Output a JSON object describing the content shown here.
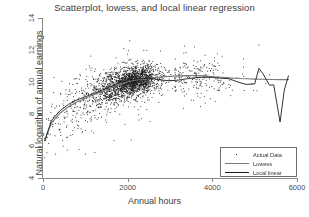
{
  "chart_data": {
    "type": "scatter",
    "title": "Scatterplot, lowess, and local linear regression",
    "xlabel": "Annual hours",
    "ylabel": "Natural logarithm of annual earnings",
    "xlim": [
      0,
      6000
    ],
    "ylim": [
      4,
      14
    ],
    "xticks": [
      0,
      2000,
      4000,
      6000
    ],
    "yticks": [
      4,
      6,
      8,
      10,
      12,
      14
    ],
    "xtick_labels": [
      "0",
      "2000",
      "4000",
      "6000"
    ],
    "ytick_labels": [
      "4",
      "6",
      "8",
      "10",
      "12",
      "14"
    ],
    "grid": false,
    "legend_position": "lower right",
    "legend": [
      {
        "label": "Actual Data",
        "marker": "point",
        "color": "#1d1d1d"
      },
      {
        "label": "Lowess",
        "marker": "line",
        "color": "#7a7a7a"
      },
      {
        "label": "Local linear",
        "marker": "line",
        "color": "#1d1d1d"
      }
    ],
    "series": [
      {
        "name": "Lowess",
        "type": "line",
        "color": "#7a7a7a",
        "x": [
          40,
          200,
          400,
          600,
          800,
          1000,
          1200,
          1400,
          1600,
          1800,
          2000,
          2200,
          2400,
          2600,
          2800,
          3000,
          3200,
          3400,
          3600,
          3800,
          4000,
          4200,
          4400,
          4600,
          4800,
          5000,
          5200,
          5400,
          5600,
          5800
        ],
        "y": [
          6.35,
          7.45,
          8.05,
          8.45,
          8.75,
          8.98,
          9.2,
          9.42,
          9.63,
          9.85,
          10.02,
          10.13,
          10.2,
          10.26,
          10.31,
          10.35,
          10.38,
          10.4,
          10.4,
          10.38,
          10.34,
          10.3,
          10.26,
          10.22,
          10.2,
          10.18,
          10.17,
          10.16,
          10.15,
          10.15
        ]
      },
      {
        "name": "Local linear",
        "type": "line",
        "color": "#1d1d1d",
        "x": [
          40,
          200,
          400,
          600,
          800,
          1000,
          1200,
          1400,
          1600,
          1800,
          2000,
          2200,
          2400,
          2600,
          2800,
          3000,
          3200,
          3400,
          3600,
          3800,
          4000,
          4200,
          4400,
          4600,
          4800,
          5000,
          5100,
          5200,
          5350,
          5450,
          5600,
          5700,
          5800
        ],
        "y": [
          6.3,
          7.6,
          8.2,
          8.6,
          8.88,
          9.08,
          9.28,
          9.5,
          9.72,
          9.95,
          10.1,
          10.18,
          10.22,
          10.2,
          10.12,
          10.08,
          10.12,
          10.2,
          10.27,
          10.3,
          10.28,
          10.24,
          10.2,
          10.0,
          9.85,
          9.88,
          10.85,
          10.5,
          9.8,
          9.82,
          7.5,
          9.5,
          10.4
        ]
      }
    ],
    "scatter": {
      "name": "Actual Data",
      "color": "#1d1d1d",
      "marker_size": 0.9,
      "n_points": 2400,
      "description": "Dense cloud, heaviest mass near 1800-2700 annual hours at log-earnings 9.8-10.8; sparse tail to 6000 hours; low outliers down to 4.3"
    }
  }
}
